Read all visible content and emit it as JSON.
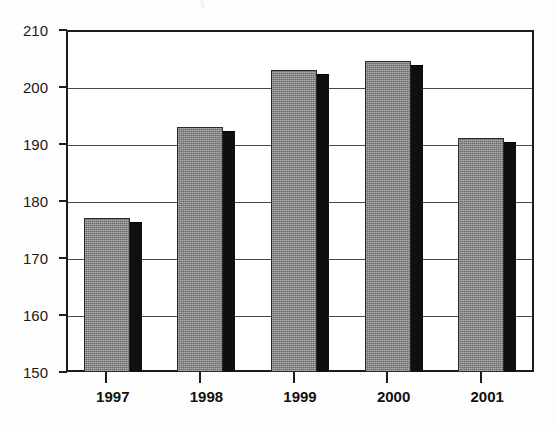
{
  "chart_data": {
    "type": "bar",
    "title": "",
    "subtitle": "",
    "xlabel": "",
    "ylabel": "",
    "categories": [
      "1997",
      "1998",
      "1999",
      "2000",
      "2001"
    ],
    "values": [
      177,
      193,
      203,
      204.5,
      191
    ],
    "ylim": [
      150,
      210
    ],
    "yticks": [
      210,
      200,
      190,
      180,
      170,
      160,
      150
    ],
    "ytick_labels": [
      "210",
      "200",
      "190",
      "180",
      "170",
      "160",
      "150"
    ],
    "grid": true,
    "grid_axis": "y",
    "legend": false,
    "legend_position": "none",
    "series": [
      {
        "name": "",
        "values": [
          177,
          193,
          203,
          204.5,
          191
        ]
      }
    ],
    "style": {
      "bar_face_color": "#8d8d8d",
      "bar_side_color": "#0f0f0f",
      "bar_outline_color": "#2a2a2a",
      "frame_color": "#1c1c1c",
      "gridline_color": "#4a4a4a",
      "background_color": "#ffffff",
      "three_d": true
    },
    "annotations": [],
    "title_remnant_text": ")"
  }
}
